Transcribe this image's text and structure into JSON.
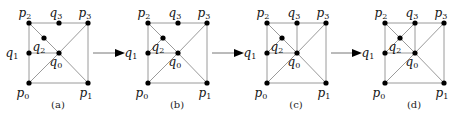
{
  "figure": {
    "panels": [
      {
        "caption": "(a)",
        "offset_x": 0,
        "extra_edges": [
          [
            "p2",
            "q2"
          ],
          [
            "q2",
            "q0"
          ],
          [
            "q1",
            "q0"
          ]
        ]
      },
      {
        "caption": "(b)",
        "offset_x": 119,
        "extra_edges": [
          [
            "p2",
            "q2"
          ],
          [
            "q2",
            "q0"
          ],
          [
            "q1",
            "q0"
          ],
          [
            "q1",
            "q2"
          ]
        ]
      },
      {
        "caption": "(c)",
        "offset_x": 238,
        "extra_edges": [
          [
            "p2",
            "q2"
          ],
          [
            "q2",
            "q0"
          ],
          [
            "q1",
            "q0"
          ],
          [
            "q1",
            "q2"
          ],
          [
            "q3",
            "q0"
          ]
        ]
      },
      {
        "caption": "(d)",
        "offset_x": 356,
        "extra_edges": [
          [
            "p2",
            "q2"
          ],
          [
            "q2",
            "q0"
          ],
          [
            "q1",
            "q0"
          ],
          [
            "q1",
            "q2"
          ],
          [
            "q3",
            "q0"
          ],
          [
            "q2",
            "q3"
          ]
        ]
      }
    ],
    "points": {
      "p0": {
        "x": 29,
        "y": 83,
        "label": "p",
        "sub": "0",
        "lx": -6,
        "ly": 14
      },
      "p1": {
        "x": 88,
        "y": 83,
        "label": "p",
        "sub": "1",
        "lx": -2,
        "ly": 14
      },
      "p2": {
        "x": 29,
        "y": 23,
        "label": "p",
        "sub": "2",
        "lx": -4,
        "ly": -6
      },
      "p3": {
        "x": 88,
        "y": 23,
        "label": "p",
        "sub": "3",
        "lx": -3,
        "ly": -6
      },
      "q0": {
        "x": 59,
        "y": 53,
        "label": "q",
        "sub": "0",
        "lx": -3,
        "ly": 13
      },
      "q1": {
        "x": 29,
        "y": 53,
        "label": "q",
        "sub": "1",
        "lx": -17,
        "ly": 4
      },
      "q2": {
        "x": 44,
        "y": 38,
        "label": "q",
        "sub": "2",
        "lx": -5,
        "ly": 13
      },
      "q3": {
        "x": 59,
        "y": 23,
        "label": "q",
        "sub": "3",
        "lx": -3,
        "ly": -6
      }
    },
    "base_edges": [
      [
        "p0",
        "p1"
      ],
      [
        "p1",
        "p3"
      ],
      [
        "p3",
        "p2"
      ],
      [
        "p2",
        "p0"
      ],
      [
        "p0",
        "q0"
      ],
      [
        "q0",
        "p3"
      ],
      [
        "q0",
        "p1"
      ]
    ],
    "arrows": [
      {
        "x1": 93,
        "y": 53,
        "x2": 125
      },
      {
        "x1": 212,
        "y": 53,
        "x2": 244
      },
      {
        "x1": 331,
        "y": 53,
        "x2": 362
      }
    ],
    "caption_y": 108,
    "caption_x": 58
  }
}
